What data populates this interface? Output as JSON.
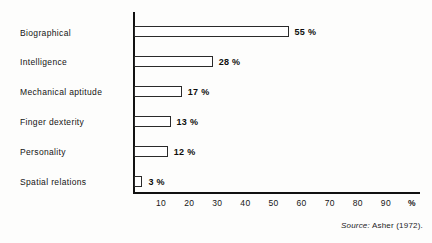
{
  "chart_data": {
    "type": "bar",
    "orientation": "horizontal",
    "title": "",
    "xlabel": "%",
    "ylabel": "",
    "xlim": [
      0,
      95
    ],
    "grid": false,
    "legend": null,
    "categories": [
      "Biographical",
      "Intelligence",
      "Mechanical aptitude",
      "Finger dexterity",
      "Personality",
      "Spatial relations"
    ],
    "values": [
      55,
      28,
      17,
      13,
      12,
      3
    ],
    "value_labels": [
      "55 %",
      "28 %",
      "17 %",
      "13 %",
      "12 %",
      "3 %"
    ],
    "tick_labels": [
      "10",
      "20",
      "30",
      "40",
      "50",
      "60",
      "70",
      "80",
      "90"
    ],
    "tick_values": [
      10,
      20,
      30,
      40,
      50,
      60,
      70,
      80,
      90
    ],
    "unit_label": "%",
    "bar_fill": "#ffffff",
    "bar_stroke": "#2a2a2a",
    "axis_color": "#111111"
  },
  "source": {
    "lead": "Source:",
    "text": "Asher (1972)."
  }
}
